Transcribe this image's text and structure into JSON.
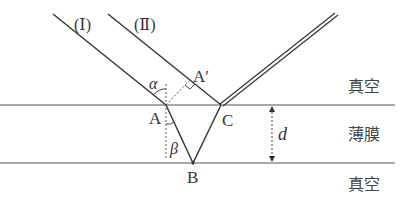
{
  "diagram": {
    "rays": [
      {
        "id": "I",
        "label": "(Ⅰ)"
      },
      {
        "id": "II",
        "label": "(Ⅱ)"
      }
    ],
    "points": {
      "A": "A",
      "A_prime": "A′",
      "B": "B",
      "C": "C"
    },
    "angles": {
      "incidence": "α",
      "refraction": "β"
    },
    "thickness_label": "d",
    "regions": {
      "top": "真空",
      "middle": "薄膜",
      "bottom": "真空"
    },
    "colors": {
      "line": "#333333",
      "text": "#333333"
    }
  }
}
